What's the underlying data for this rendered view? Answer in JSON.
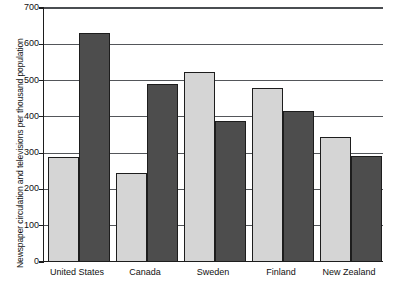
{
  "chart_data": {
    "type": "bar",
    "title": "",
    "xlabel": "",
    "ylabel": "Newspaper circulation and televisions per thousand population",
    "categories": [
      "United States",
      "Canada",
      "Sweden",
      "Finland",
      "New Zealand"
    ],
    "series": [
      {
        "name": "Newspaper circulation per thousand population",
        "color": "#d5d5d5",
        "values": [
          290,
          245,
          525,
          480,
          345
        ]
      },
      {
        "name": "Televisions per thousand population",
        "color": "#4d4d4d",
        "values": [
          630,
          490,
          390,
          415,
          293
        ]
      }
    ],
    "ylim": [
      0,
      700
    ],
    "ytick_values": [
      0,
      100,
      200,
      300,
      400,
      500,
      600,
      700
    ],
    "ytick_labels": [
      "0",
      "100",
      "200",
      "300",
      "400",
      "500",
      "600",
      "700"
    ],
    "grid": true,
    "grid_axis": "y",
    "legend": "none",
    "legend_position": "none"
  },
  "axes": {
    "y_title": "Newspaper circulation and televisions per thousand population",
    "y_ticks": [
      "700",
      "600",
      "500",
      "400",
      "300",
      "200",
      "100",
      "0"
    ]
  },
  "colors": {
    "light_bar": "#d5d5d5",
    "dark_bar": "#4d4d4d",
    "gridline": "#53565a",
    "axis": "#1d1d1d",
    "background": "#ffffff",
    "text": "#111111"
  }
}
